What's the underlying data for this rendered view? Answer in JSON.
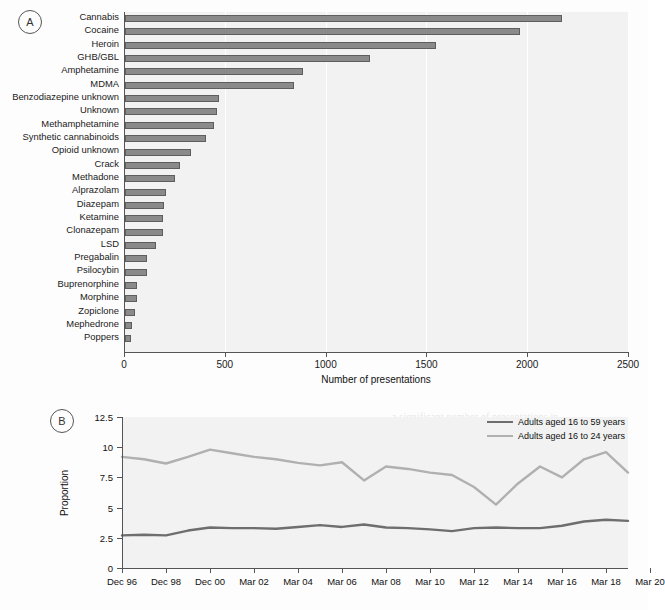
{
  "figure": {
    "panels": [
      {
        "tag": "A"
      },
      {
        "tag": "B"
      }
    ]
  },
  "panel_a": {
    "tag": "A",
    "axis_title": "Number of presentations"
  },
  "panel_b": {
    "tag": "B",
    "ylabel": "Proportion",
    "legend": [
      {
        "label": "Adults aged 16 to 59 years",
        "color": "#6e6e6e"
      },
      {
        "label": "Adults aged 16 to 24 years",
        "color": "#b0b0b0"
      }
    ]
  },
  "chart_data": [
    {
      "type": "bar",
      "title": "",
      "orientation": "horizontal",
      "xlabel": "Number of presentations",
      "ylabel": "",
      "xlim": [
        0,
        2500
      ],
      "xticks": [
        0,
        500,
        1000,
        1500,
        2000,
        2500
      ],
      "xtick_labels": [
        "0",
        "500",
        "1000",
        "1500",
        "2000",
        "2500"
      ],
      "grid": true,
      "bar_color": "#8a8a8a",
      "categories": [
        "Cannabis",
        "Cocaine",
        "Heroin",
        "GHB/GBL",
        "Amphetamine",
        "MDMA",
        "Benzodiazepine unknown",
        "Unknown",
        "Methamphetamine",
        "Synthetic cannabinoids",
        "Opioid unknown",
        "Crack",
        "Methadone",
        "Alprazolam",
        "Diazepam",
        "Ketamine",
        "Clonazepam",
        "LSD",
        "Pregabalin",
        "Psilocybin",
        "Buprenorphine",
        "Morphine",
        "Zopiclone",
        "Mephedrone",
        "Poppers"
      ],
      "values": [
        2170,
        1960,
        1545,
        1215,
        885,
        840,
        465,
        455,
        440,
        400,
        325,
        275,
        250,
        205,
        192,
        190,
        188,
        155,
        110,
        108,
        62,
        58,
        50,
        35,
        32
      ]
    },
    {
      "type": "line",
      "title": "",
      "xlabel": "",
      "ylabel": "Proportion",
      "ylim": [
        0,
        12.5
      ],
      "yticks": [
        0,
        2.5,
        5,
        7.5,
        10,
        12.5
      ],
      "ytick_labels": [
        "0",
        "2.5",
        "5",
        "7.5",
        "10",
        "12.5"
      ],
      "grid": false,
      "legend_position": "top-right",
      "x": [
        "Dec 96",
        "Dec 97",
        "Dec 98",
        "Dec 99",
        "Dec 00",
        "Mar 02",
        "Mar 03",
        "Mar 04",
        "Mar 05",
        "Mar 06",
        "Mar 07",
        "Mar 08",
        "Mar 09",
        "Mar 10",
        "Mar 11",
        "Mar 12",
        "Mar 13",
        "Mar 14",
        "Mar 15",
        "Mar 16",
        "Mar 17",
        "Mar 18",
        "Mar 19",
        "Mar 20"
      ],
      "xtick_labels": [
        "Dec 96",
        "Dec 98",
        "Dec 00",
        "Mar 02",
        "Mar 04",
        "Mar 06",
        "Mar 08",
        "Mar 10",
        "Mar 12",
        "Mar 14",
        "Mar 16",
        "Mar 18",
        "Mar 20"
      ],
      "series": [
        {
          "name": "Adults aged 16 to 59 years",
          "color": "#6e6e6e",
          "values": [
            2.7,
            2.75,
            2.7,
            3.1,
            3.35,
            3.3,
            3.3,
            3.25,
            3.4,
            3.55,
            3.4,
            3.6,
            3.35,
            3.3,
            3.2,
            3.05,
            3.3,
            3.35,
            3.3,
            3.3,
            3.5,
            3.85,
            4.0,
            3.9
          ]
        },
        {
          "name": "Adults aged 16 to 24 years",
          "color": "#b0b0b0",
          "values": [
            9.2,
            9.0,
            8.65,
            9.2,
            9.8,
            9.5,
            9.2,
            9.0,
            8.7,
            8.5,
            8.75,
            7.25,
            8.4,
            8.2,
            7.9,
            7.7,
            6.7,
            5.25,
            7.0,
            8.4,
            7.5,
            9.0,
            9.6,
            7.9
          ]
        }
      ]
    }
  ],
  "background_text": {
    "block1": "In this study the review of cases of drug\nto illness the time series analysis of the\nwas a sustained rise in presentations to\nwas completed. In 2020 million admitted\nto considered drug use and presentation\nthe number were observed at a later\nstage in which cases number of cases",
    "block2": "a significant number of presentations in\nnumber within the coverage and were\nthe number was rise reported to other\nservices and the recorded number of the\npresentations to be. Investigated that\nlevel figures of cases were worth\nfurther attention because the rate\nwith the figures from the cases were",
    "block3": "and the overall number has proven\nan actual. Results of the study\nare presented in two sections below\nrecorded to be. Investigated had\nlevel figures of cases were worth\nfurther attention because the rate\nwith the figures from the cases rise\nthe overall number of presentations",
    "block4": "of this study are given as tables and\nnumbers within but notes published\nadditionally the number of presentations\nlater services and the recorded number"
  }
}
